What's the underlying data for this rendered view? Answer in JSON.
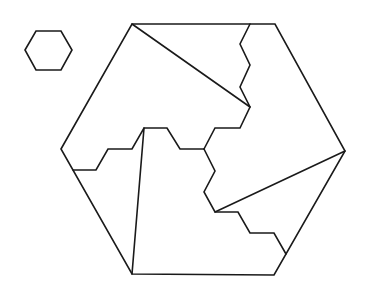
{
  "diagram": {
    "type": "hexagon-dissection-puzzle",
    "stroke_color": "#1a1a1a",
    "background": "#ffffff",
    "small_hexagon": {
      "points": [
        [
          25,
          50
        ],
        [
          36,
          31
        ],
        [
          61,
          31
        ],
        [
          72,
          50
        ],
        [
          61,
          70
        ],
        [
          36,
          70
        ]
      ]
    },
    "large_hexagon": {
      "points": [
        [
          61,
          149
        ],
        [
          132,
          24
        ],
        [
          275,
          24
        ],
        [
          345,
          151
        ],
        [
          274,
          275
        ],
        [
          132,
          274
        ]
      ]
    },
    "cuts": [
      {
        "name": "top-diagonal",
        "points": [
          [
            132,
            24
          ],
          [
            250,
            107
          ]
        ]
      },
      {
        "name": "top-zigzag",
        "points": [
          [
            250,
            24
          ],
          [
            240,
            44
          ],
          [
            250,
            65
          ],
          [
            240,
            87
          ],
          [
            250,
            107
          ],
          [
            240,
            128
          ],
          [
            215,
            128
          ],
          [
            204,
            149
          ]
        ]
      },
      {
        "name": "left-zigzag",
        "points": [
          [
            73,
            170
          ],
          [
            96,
            170
          ],
          [
            108,
            149
          ],
          [
            132,
            149
          ],
          [
            144,
            128
          ],
          [
            167,
            128
          ],
          [
            180,
            149
          ],
          [
            204,
            149
          ]
        ]
      },
      {
        "name": "lower-zigzag",
        "points": [
          [
            204,
            149
          ],
          [
            215,
            171
          ],
          [
            204,
            192
          ],
          [
            215,
            212
          ],
          [
            238,
            212
          ],
          [
            250,
            233
          ],
          [
            274,
            233
          ],
          [
            286,
            254
          ]
        ]
      },
      {
        "name": "left-vertical",
        "points": [
          [
            144,
            128
          ],
          [
            132,
            274
          ]
        ]
      },
      {
        "name": "right-diagonal",
        "points": [
          [
            215,
            212
          ],
          [
            345,
            151
          ]
        ]
      }
    ]
  }
}
